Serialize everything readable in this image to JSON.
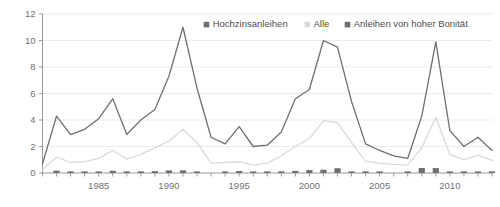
{
  "chart_data": {
    "type": "line",
    "title": "",
    "subtitle": "",
    "xlabel": "",
    "ylabel": "",
    "xlim": [
      1981,
      2013
    ],
    "ylim": [
      0,
      12
    ],
    "grid": true,
    "legend_position": "top-right",
    "y_ticks": [
      "0",
      "2",
      "4",
      "6",
      "8",
      "10",
      "12"
    ],
    "y_tick_values": [
      0,
      2,
      4,
      6,
      8,
      10,
      12
    ],
    "x_ticks": [
      "1985",
      "1990",
      "1995",
      "2000",
      "2005",
      "2010"
    ],
    "x_tick_values": [
      1985,
      1990,
      1995,
      2000,
      2005,
      2010
    ],
    "x": [
      1981,
      1982,
      1983,
      1984,
      1985,
      1986,
      1987,
      1988,
      1989,
      1990,
      1991,
      1992,
      1993,
      1994,
      1995,
      1996,
      1997,
      1998,
      1999,
      2000,
      2001,
      2002,
      2003,
      2004,
      2005,
      2006,
      2007,
      2008,
      2009,
      2010,
      2011,
      2012,
      2013
    ],
    "series": [
      {
        "name": "Hochzinsanleihen",
        "type": "line",
        "color": "#6f6f6f",
        "values": [
          0.7,
          4.3,
          2.9,
          3.3,
          4.1,
          5.6,
          2.9,
          4.0,
          4.8,
          7.3,
          11.0,
          6.4,
          2.7,
          2.2,
          3.5,
          2.0,
          2.1,
          3.1,
          5.6,
          6.3,
          10.0,
          9.5,
          5.4,
          2.2,
          1.7,
          1.3,
          1.1,
          4.3,
          9.9,
          3.2,
          2.0,
          2.7,
          1.7
        ]
      },
      {
        "name": "Alle",
        "type": "line",
        "color": "#d9d9d9",
        "values": [
          0.25,
          1.2,
          0.8,
          0.85,
          1.1,
          1.7,
          1.05,
          1.4,
          1.9,
          2.4,
          3.3,
          2.3,
          0.75,
          0.8,
          0.85,
          0.6,
          0.75,
          1.3,
          2.0,
          2.6,
          3.95,
          3.8,
          2.3,
          0.9,
          0.75,
          0.65,
          0.6,
          1.9,
          4.2,
          1.4,
          1.0,
          1.35,
          0.95
        ]
      },
      {
        "name": "Anleihen von hoher Bonität",
        "type": "bar",
        "color": "#6f6f6f",
        "values": [
          0.0,
          0.18,
          0.06,
          0.09,
          0.05,
          0.17,
          0.03,
          0.02,
          0.14,
          0.19,
          0.2,
          0.02,
          0.0,
          0.12,
          0.15,
          0.02,
          0.03,
          0.13,
          0.16,
          0.22,
          0.25,
          0.36,
          0.1,
          0.06,
          0.03,
          0.0,
          0.02,
          0.38,
          0.37,
          0.03,
          0.12,
          0.02,
          0.01
        ]
      }
    ],
    "legend": [
      {
        "label": "Hochzinsanleihen",
        "color": "#6f6f6f",
        "marker": "square"
      },
      {
        "label": "Alle",
        "color": "#d9d9d9",
        "marker": "square"
      },
      {
        "label": "Anleihen von hoher Bonität",
        "color": "#6f6f6f",
        "marker": "square"
      }
    ]
  }
}
